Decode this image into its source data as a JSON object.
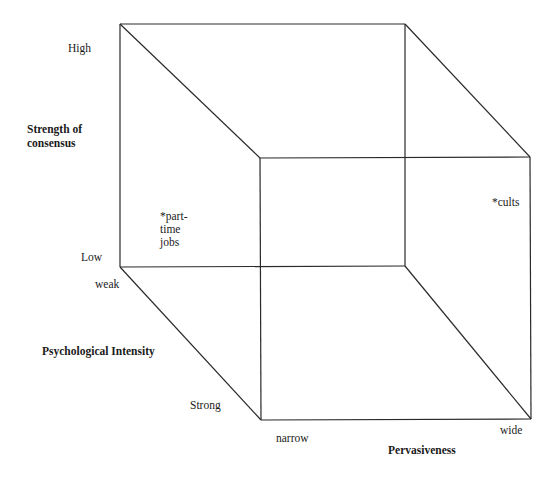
{
  "diagram": {
    "type": "3D cube (three-dimensional typology)",
    "line_color": "#2a2a2a",
    "axes": {
      "vertical": {
        "title_line1": "Strength of",
        "title_line2": "consensus",
        "high": "High",
        "low": "Low"
      },
      "depth": {
        "title": "Psychological Intensity",
        "start": "weak",
        "end": "Strong"
      },
      "horizontal": {
        "title": "Pervasiveness",
        "start": "narrow",
        "end": "wide"
      }
    },
    "points": [
      {
        "lines": [
          "*part-",
          "time",
          "jobs"
        ]
      },
      {
        "lines": [
          "*cults"
        ]
      }
    ]
  }
}
